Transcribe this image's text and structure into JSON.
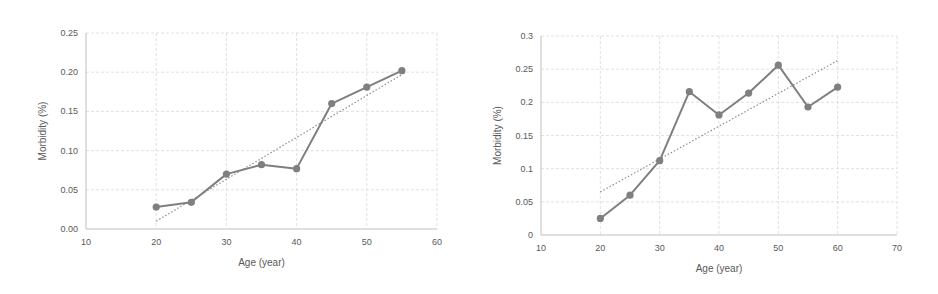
{
  "chart_data": [
    {
      "type": "line",
      "title": "",
      "xlabel": "Age (year)",
      "ylabel": "Morbidity (%)",
      "xlim": [
        10,
        60
      ],
      "ylim": [
        0,
        0.25
      ],
      "xticks": [
        10,
        20,
        30,
        40,
        50,
        60
      ],
      "yticks": [
        0.0,
        0.05,
        0.1,
        0.15,
        0.2,
        0.25
      ],
      "ytick_labels": [
        "0.00",
        "0.05",
        "0.10",
        "0.15",
        "0.20",
        "0.25"
      ],
      "grid": true,
      "legend": null,
      "x": [
        20,
        25,
        30,
        35,
        40,
        45,
        50,
        55
      ],
      "series": [
        {
          "name": "Morbidity",
          "values": [
            0.028,
            0.034,
            0.07,
            0.082,
            0.077,
            0.16,
            0.181,
            0.202
          ]
        }
      ],
      "trendline": {
        "type": "linear",
        "x": [
          20,
          55
        ],
        "y": [
          0.01,
          0.197
        ]
      }
    },
    {
      "type": "line",
      "title": "",
      "xlabel": "Age (year)",
      "ylabel": "Morbidity (%)",
      "xlim": [
        10,
        70
      ],
      "ylim": [
        0,
        0.3
      ],
      "xticks": [
        10,
        20,
        30,
        40,
        50,
        60,
        70
      ],
      "yticks": [
        0,
        0.05,
        0.1,
        0.15,
        0.2,
        0.25,
        0.3
      ],
      "ytick_labels": [
        "0",
        "0.05",
        "0.1",
        "0.15",
        "0.2",
        "0.25",
        "0.3"
      ],
      "grid": true,
      "legend": null,
      "x": [
        20,
        25,
        30,
        35,
        40,
        45,
        50,
        55,
        60
      ],
      "series": [
        {
          "name": "Morbidity",
          "values": [
            0.025,
            0.06,
            0.112,
            0.216,
            0.181,
            0.214,
            0.256,
            0.193,
            0.223
          ]
        }
      ],
      "trendline": {
        "type": "linear",
        "x": [
          20,
          60
        ],
        "y": [
          0.065,
          0.263
        ]
      }
    }
  ],
  "charts": [
    {
      "xlabel": "Age (year)",
      "ylabel": "Morbidity (%)"
    },
    {
      "xlabel": "Age (year)",
      "ylabel": "Morbidity (%)"
    }
  ]
}
